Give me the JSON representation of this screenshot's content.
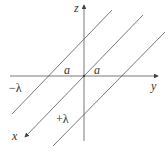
{
  "diagram": {
    "type": "3d-axes-with-line-charges",
    "axes": {
      "z_label": "z",
      "y_label": "y",
      "x_label": "x"
    },
    "lines": [
      {
        "name": "left-line-charge",
        "label": "−λ"
      },
      {
        "name": "center-line",
        "label": ""
      },
      {
        "name": "right-line-charge",
        "label": "+λ"
      }
    ],
    "distance_labels": [
      "a",
      "a"
    ],
    "colors": {
      "line": "#555555",
      "text": "#333333"
    }
  }
}
